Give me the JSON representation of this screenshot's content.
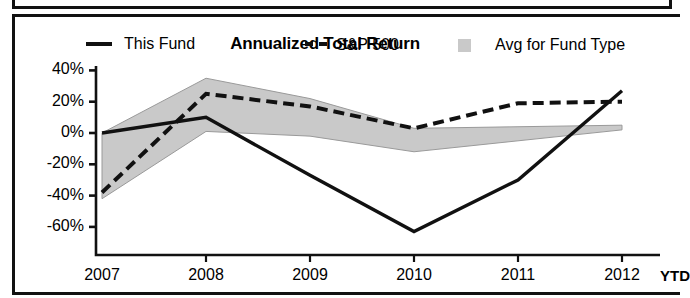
{
  "panel": {
    "title": "Annualized Total Return"
  },
  "legend": {
    "items": [
      {
        "label": "This Fund",
        "marker": "solid-line-swatch"
      },
      {
        "label": "S&P 500",
        "marker": "dashed-line-swatch"
      },
      {
        "label": "Avg for Fund Type",
        "marker": "shaded-box-swatch"
      }
    ]
  },
  "axis": {
    "y_ticks": [
      "40%",
      "20%",
      "0%",
      "-20%",
      "-40%",
      "-60%"
    ],
    "x_ticks": [
      "2007",
      "2008",
      "2009",
      "2010",
      "2011",
      "2012"
    ],
    "x_suffix": "YTD"
  },
  "colors": {
    "line": "#111111",
    "band": "#c9c9c9",
    "band_edge": "#9a9a9a",
    "frame": "#111111",
    "background": "#ffffff"
  },
  "chart_data": {
    "type": "line",
    "title": "Annualized Total Return",
    "xlabel": "",
    "ylabel": "",
    "x": [
      "2007",
      "2008",
      "2009",
      "2010",
      "2011",
      "2012"
    ],
    "ylim": [
      -70,
      45
    ],
    "ytick_values": [
      40,
      20,
      0,
      -20,
      -40,
      -60
    ],
    "grid": false,
    "legend_position": "top",
    "series": [
      {
        "name": "This Fund",
        "style": "solid",
        "values": [
          0,
          10,
          -27,
          -63,
          -30,
          27
        ]
      },
      {
        "name": "S&P 500",
        "style": "dashed",
        "values": [
          -38,
          25,
          17,
          3,
          19,
          20
        ]
      }
    ],
    "band": {
      "name": "Avg for Fund Type",
      "style": "shaded-area",
      "upper": [
        0,
        35,
        22,
        3,
        4,
        5
      ],
      "lower": [
        -42,
        1,
        -2,
        -12,
        -5,
        2
      ]
    }
  }
}
